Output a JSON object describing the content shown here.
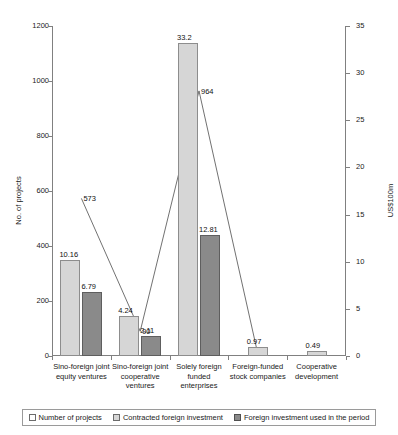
{
  "chart_data": {
    "type": "bar",
    "title": "",
    "xlabel": "",
    "ylabel": "No. of projects",
    "ylabel_right": "US$100m",
    "ylim": [
      0,
      1200
    ],
    "ylim_right": [
      0,
      35
    ],
    "yticks": [
      "0",
      "200",
      "400",
      "600",
      "800",
      "1000",
      "1200"
    ],
    "yticks_right": [
      "0",
      "5",
      "10",
      "15",
      "20",
      "25",
      "30",
      "35"
    ],
    "grid": false,
    "legend_position": "bottom",
    "categories": [
      "Sino-foreign joint equity ventures",
      "Sino-foreign joint cooperative ventures",
      "Solely foreign funded enterprises",
      "Foreign-funded stock companies",
      "Cooperative development"
    ],
    "series": [
      {
        "name": "Number of projects",
        "axis": "left",
        "unit": "projects",
        "type": "line",
        "values": [
          573,
          90,
          964,
          8,
          null
        ],
        "labels": [
          "573",
          "90",
          "964",
          "",
          ""
        ]
      },
      {
        "name": "Contracted foreign investment",
        "axis": "right",
        "unit": "US$100m",
        "type": "bar",
        "values": [
          10.16,
          4.24,
          33.2,
          0.97,
          0.49
        ],
        "labels": [
          "10.16",
          "4.24",
          "33.2",
          "0.97",
          "0.49"
        ]
      },
      {
        "name": "Foreign investment used in the period",
        "axis": "right",
        "unit": "US$100m",
        "type": "bar",
        "values": [
          6.79,
          2.11,
          12.81,
          null,
          null
        ],
        "labels": [
          "6.79",
          "2.11",
          "12.81",
          "",
          ""
        ]
      }
    ]
  },
  "legend": {
    "items": [
      "Number of projects",
      "Contracted foreign investment",
      "Foreign investment used in the period"
    ]
  },
  "colors": {
    "light_bar": "#d6d6d6",
    "dark_bar": "#8a8a8a",
    "axis": "#808080",
    "text": "#1a1a1a"
  }
}
